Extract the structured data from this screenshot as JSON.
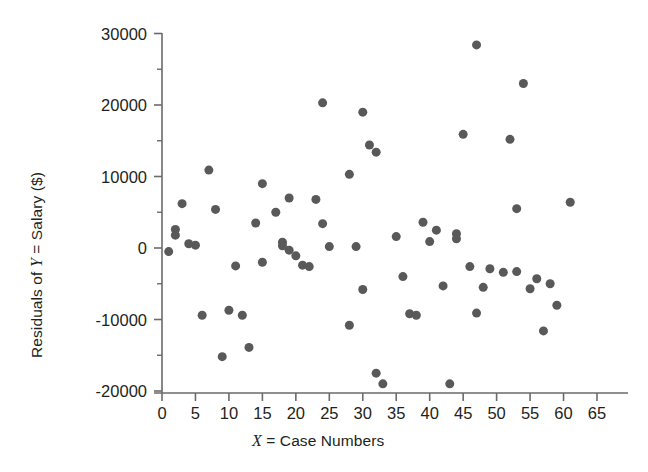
{
  "chart_data": {
    "type": "scatter",
    "title": "",
    "xlabel": "X = Case Numbers",
    "ylabel": "Residuals of Y = Salary ($)",
    "xlim": [
      -1.5,
      67
    ],
    "ylim": [
      -21500,
      31500
    ],
    "xticks": [
      0,
      5,
      10,
      15,
      20,
      25,
      30,
      35,
      40,
      45,
      50,
      55,
      60,
      65
    ],
    "xtick_labels": [
      "0",
      "5",
      "10",
      "15",
      "20",
      "25",
      "30",
      "35",
      "40",
      "45",
      "50",
      "55",
      "60",
      "65"
    ],
    "yticks": [
      -20000,
      -10000,
      0,
      10000,
      20000,
      30000
    ],
    "ytick_labels": [
      "-20000",
      "-10000",
      "0",
      "10000",
      "20000",
      "30000"
    ],
    "y_minor_ticks": [
      -15000,
      -5000,
      5000,
      15000,
      25000
    ],
    "grid": false,
    "legend": null,
    "marker_color": "#595959",
    "marker_size": 9,
    "axis_color": "#6d6a68",
    "points": [
      {
        "x": 1,
        "y": -500
      },
      {
        "x": 2,
        "y": 2600
      },
      {
        "x": 2,
        "y": 1800
      },
      {
        "x": 3,
        "y": 6200
      },
      {
        "x": 4,
        "y": 600
      },
      {
        "x": 5,
        "y": 400
      },
      {
        "x": 6,
        "y": -9400
      },
      {
        "x": 7,
        "y": 10900
      },
      {
        "x": 8,
        "y": 5400
      },
      {
        "x": 9,
        "y": -15200
      },
      {
        "x": 10,
        "y": -8700
      },
      {
        "x": 11,
        "y": -2500
      },
      {
        "x": 12,
        "y": -9400
      },
      {
        "x": 13,
        "y": -13900
      },
      {
        "x": 14,
        "y": 3500
      },
      {
        "x": 15,
        "y": -2000
      },
      {
        "x": 15,
        "y": 9000
      },
      {
        "x": 17,
        "y": 5000
      },
      {
        "x": 18,
        "y": 800
      },
      {
        "x": 18,
        "y": 300
      },
      {
        "x": 19,
        "y": 7000
      },
      {
        "x": 19,
        "y": -300
      },
      {
        "x": 20,
        "y": -1100
      },
      {
        "x": 21,
        "y": -2400
      },
      {
        "x": 22,
        "y": -2600
      },
      {
        "x": 23,
        "y": 6800
      },
      {
        "x": 24,
        "y": 20300
      },
      {
        "x": 24,
        "y": 3400
      },
      {
        "x": 25,
        "y": 200
      },
      {
        "x": 28,
        "y": 10300
      },
      {
        "x": 28,
        "y": -10800
      },
      {
        "x": 29,
        "y": 200
      },
      {
        "x": 30,
        "y": 19000
      },
      {
        "x": 30,
        "y": -5800
      },
      {
        "x": 31,
        "y": 14400
      },
      {
        "x": 32,
        "y": 13400
      },
      {
        "x": 32,
        "y": -17500
      },
      {
        "x": 33,
        "y": -19000
      },
      {
        "x": 35,
        "y": 1600
      },
      {
        "x": 36,
        "y": -4000
      },
      {
        "x": 37,
        "y": -9200
      },
      {
        "x": 38,
        "y": -9400
      },
      {
        "x": 39,
        "y": 3600
      },
      {
        "x": 40,
        "y": 900
      },
      {
        "x": 41,
        "y": 2500
      },
      {
        "x": 42,
        "y": -5300
      },
      {
        "x": 43,
        "y": -19000
      },
      {
        "x": 44,
        "y": 2000
      },
      {
        "x": 44,
        "y": 1300
      },
      {
        "x": 45,
        "y": 15900
      },
      {
        "x": 46,
        "y": -2600
      },
      {
        "x": 47,
        "y": 28400
      },
      {
        "x": 47,
        "y": -9100
      },
      {
        "x": 48,
        "y": -5500
      },
      {
        "x": 49,
        "y": -2900
      },
      {
        "x": 51,
        "y": -3400
      },
      {
        "x": 52,
        "y": 15200
      },
      {
        "x": 53,
        "y": 5500
      },
      {
        "x": 53,
        "y": -3300
      },
      {
        "x": 54,
        "y": 23000
      },
      {
        "x": 55,
        "y": -5700
      },
      {
        "x": 56,
        "y": -4300
      },
      {
        "x": 57,
        "y": -11600
      },
      {
        "x": 58,
        "y": -5000
      },
      {
        "x": 59,
        "y": -8000
      },
      {
        "x": 61,
        "y": 6400
      }
    ]
  },
  "axes": {
    "x_title_prefix": "X",
    "x_title_rest": " = Case Numbers",
    "y_title_prefix": "Residuals of ",
    "y_title_var": "Y",
    "y_title_rest": " = Salary ($)"
  }
}
